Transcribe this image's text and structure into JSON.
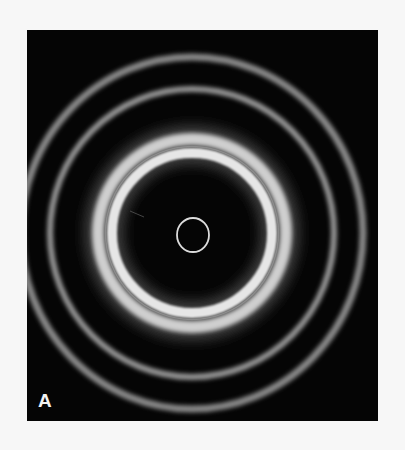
{
  "figure": {
    "panel_label": "A",
    "colors": {
      "background": "#050505",
      "ring_bright": "#d8d8d8",
      "ring_dim": "#9a9a9a",
      "page": "#f7f7f7"
    },
    "rings": [
      {
        "name": "inner-small-ring",
        "radius": 17,
        "width": 2,
        "intensity": 0.85
      },
      {
        "name": "wide-band-inner",
        "radius": 80,
        "width": 10,
        "intensity": 0.9
      },
      {
        "name": "wide-band-outer",
        "radius": 94,
        "width": 11,
        "intensity": 0.85
      },
      {
        "name": "middle-ring",
        "radius": 143,
        "width": 7,
        "intensity": 0.6
      },
      {
        "name": "outer-ring",
        "radius": 174,
        "width": 8,
        "intensity": 0.55
      }
    ]
  }
}
